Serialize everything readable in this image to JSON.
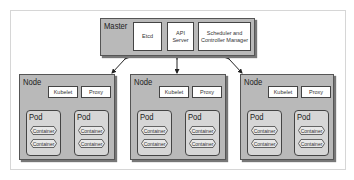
{
  "master": {
    "label": "Master",
    "components": [
      {
        "label": "Etcd"
      },
      {
        "label": "API Server"
      },
      {
        "label": "Scheduler and Controller Manager"
      }
    ]
  },
  "nodes": [
    {
      "label": "Node",
      "kubelet": "Kubelet",
      "proxy": "Proxy",
      "pods": [
        {
          "label": "Pod",
          "containers": [
            "Container",
            "Container"
          ]
        },
        {
          "label": "Pod",
          "containers": [
            "Container",
            "Container"
          ]
        }
      ]
    },
    {
      "label": "Node",
      "kubelet": "Kubelet",
      "proxy": "Proxy",
      "pods": [
        {
          "label": "Pod",
          "containers": [
            "Container",
            "Container"
          ]
        },
        {
          "label": "Pod",
          "containers": [
            "Container",
            "Container"
          ]
        }
      ]
    },
    {
      "label": "Node",
      "kubelet": "Kubelet",
      "proxy": "Proxy",
      "pods": [
        {
          "label": "Pod",
          "containers": [
            "Container",
            "Container"
          ]
        },
        {
          "label": "Pod",
          "containers": [
            "Container",
            "Container"
          ]
        }
      ]
    }
  ],
  "colors": {
    "box_fill": "#b9b9b9",
    "pod_fill": "#d6d6d6",
    "component_fill": "#ffffff",
    "stroke": "#444444"
  }
}
